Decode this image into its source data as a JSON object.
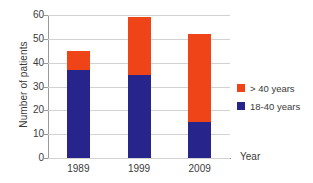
{
  "chart_data": {
    "type": "bar",
    "stacked": true,
    "title": "",
    "xlabel": "Year",
    "ylabel": "Number of patients",
    "categories": [
      "1989",
      "1999",
      "2009"
    ],
    "series": [
      {
        "name": "18-40 years",
        "color": "#27258C",
        "values": [
          37,
          35,
          15
        ]
      },
      {
        "name": "> 40 years",
        "color": "#EE4418",
        "values": [
          8,
          24,
          37
        ]
      }
    ],
    "totals": [
      45,
      59,
      52
    ],
    "ylim": [
      0,
      60
    ],
    "yticks": [
      0,
      10,
      20,
      30,
      40,
      50,
      60
    ],
    "ytick_labels": [
      "0",
      "10",
      "20",
      "30",
      "40",
      "50",
      "60"
    ],
    "grid": true,
    "legend_position": "right",
    "legend_entries": [
      {
        "label": "> 40 years",
        "color": "#EE4418"
      },
      {
        "label": "18-40 years",
        "color": "#27258C"
      }
    ],
    "background": "#FFFFFF",
    "grid_color": "#D2D2D2",
    "axis_color": "#9A9A9A"
  }
}
